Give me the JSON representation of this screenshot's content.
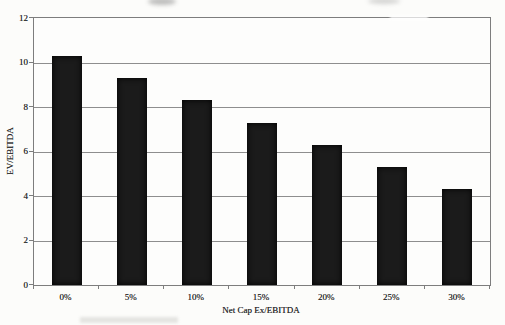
{
  "figure": {
    "background_color": "#fcfcfa",
    "style": "scanned-book-figure"
  },
  "chart_data": {
    "type": "bar",
    "title": "",
    "categories": [
      "0%",
      "5%",
      "10%",
      "15%",
      "20%",
      "25%",
      "30%"
    ],
    "values": [
      10.3,
      9.3,
      8.3,
      7.3,
      6.3,
      5.3,
      4.3
    ],
    "xlabel": "Net Cap Ex/EBITDA",
    "ylabel": "EV/EBITDA",
    "ylim": [
      0,
      12
    ],
    "yticks": [
      0,
      2,
      4,
      6,
      8,
      10,
      12
    ],
    "grid": true,
    "legend": "none",
    "bar_color": "#1b1b1b",
    "gridline_color": "#8e8e8e",
    "axis_color": "#7d7d7d",
    "text_color": "#2b2b2b"
  }
}
